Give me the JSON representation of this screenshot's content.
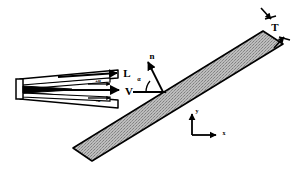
{
  "figure": {
    "background_color": "#ffffff",
    "ink_color": "#000000",
    "plate_fill_color": "#b4b4b4",
    "plate_outline_color": "#000000"
  },
  "labels": {
    "thickness": "T",
    "lift": "L",
    "velocity": "V",
    "normal": "n",
    "angle": "α",
    "plus_alpha": "+α",
    "minus_alpha": "-α",
    "axis_x": "x",
    "axis_y": "y"
  },
  "elements": {
    "plate": {
      "name": "inclined-plate",
      "shape": "parallelogram",
      "fill": "#b4b4b4",
      "texture": "stipple",
      "inclination_deg": 27,
      "thickness_label": "T"
    },
    "blade_assembly": {
      "name": "wedge-blade-pair",
      "fill": "#ffffff",
      "outline": "#000000",
      "blade_count": 2,
      "upper_blade_label": "+α",
      "lower_blade_label": "-α"
    },
    "vectors": [
      {
        "name": "lift-vector",
        "label": "L",
        "direction": "right"
      },
      {
        "name": "velocity-vector",
        "label": "V",
        "direction": "right"
      },
      {
        "name": "normal-vector",
        "label": "n",
        "direction": "up-left"
      },
      {
        "name": "plus-alpha-vector",
        "label": "+α",
        "direction": "right"
      },
      {
        "name": "minus-alpha-vector",
        "label": "-α",
        "direction": "right"
      }
    ],
    "axes": {
      "name": "coordinate-axes",
      "x_label": "x",
      "y_label": "y",
      "origin": "lower-right"
    },
    "angle_arc": {
      "name": "angle-of-attack-arc",
      "label": "α",
      "value_deg": 27
    },
    "thickness_dimension": {
      "name": "thickness-dimension",
      "label": "T",
      "style": "opposing-arrows"
    }
  }
}
